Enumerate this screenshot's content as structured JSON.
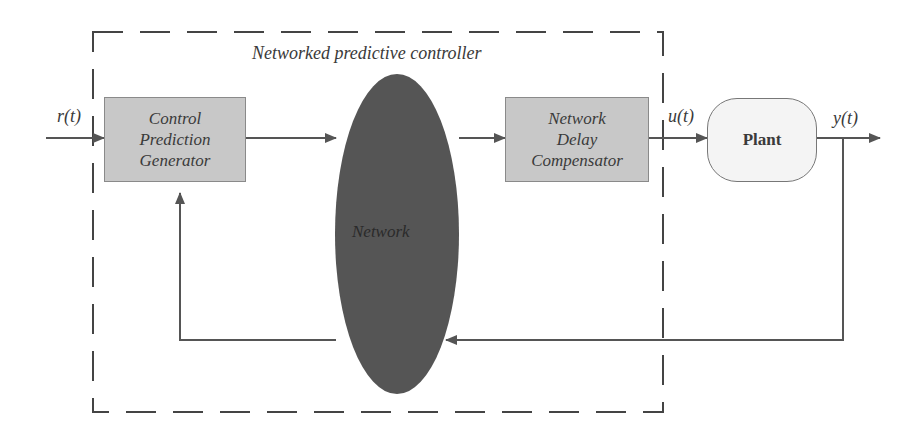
{
  "diagram": {
    "type": "block-diagram",
    "colors": {
      "block_fill": "#c8c8c8",
      "network_fill": "#555555",
      "plant_fill": "#f4f4f4",
      "line": "#555555"
    },
    "container": {
      "label": "Networked predictive controller",
      "style": "dashed"
    },
    "signals": {
      "reference": "r(t)",
      "control": "u(t)",
      "output": "y(t)"
    },
    "blocks": {
      "cpg": {
        "lines": [
          "Control",
          "Prediction",
          "Generator"
        ]
      },
      "network": {
        "label": "Network"
      },
      "ndc": {
        "lines": [
          "Network",
          "Delay",
          "Compensator"
        ]
      },
      "plant": {
        "label": "Plant"
      }
    },
    "edges": [
      {
        "from": "r(t)",
        "to": "Control Prediction Generator"
      },
      {
        "from": "Control Prediction Generator",
        "to": "Network"
      },
      {
        "from": "Network",
        "to": "Network Delay Compensator"
      },
      {
        "from": "Network Delay Compensator",
        "to": "Plant",
        "label": "u(t)"
      },
      {
        "from": "Plant",
        "to": "output",
        "label": "y(t)"
      },
      {
        "from": "y(t)",
        "to": "Network",
        "type": "feedback"
      },
      {
        "from": "Network",
        "to": "Control Prediction Generator",
        "type": "feedback"
      }
    ]
  }
}
